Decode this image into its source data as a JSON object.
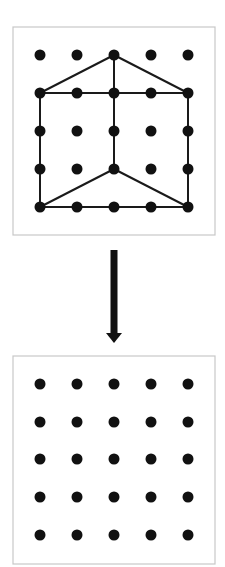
{
  "diagram": {
    "colors": {
      "dot": "#111111",
      "line": "#1a1a1a",
      "frame": "#c8c8c8",
      "background": "#ffffff"
    },
    "grid_columns": [
      40,
      77,
      114,
      151,
      188
    ],
    "top_board": {
      "frame": {
        "x": 13,
        "y": 27,
        "w": 202,
        "h": 208
      },
      "grid_rows": [
        55,
        93,
        131,
        169,
        207
      ],
      "segments": [
        [
          [
            0,
            1
          ],
          [
            2,
            0
          ]
        ],
        [
          [
            2,
            0
          ],
          [
            4,
            1
          ]
        ],
        [
          [
            0,
            1
          ],
          [
            4,
            1
          ]
        ],
        [
          [
            2,
            0
          ],
          [
            2,
            3
          ]
        ],
        [
          [
            0,
            1
          ],
          [
            0,
            4
          ]
        ],
        [
          [
            4,
            1
          ],
          [
            4,
            4
          ]
        ],
        [
          [
            0,
            4
          ],
          [
            4,
            4
          ]
        ],
        [
          [
            0,
            4
          ],
          [
            2,
            3
          ]
        ],
        [
          [
            2,
            3
          ],
          [
            4,
            4
          ]
        ]
      ]
    },
    "arrow": {
      "x": 114,
      "y1": 250,
      "y2": 343,
      "direction": "down"
    },
    "bottom_board": {
      "frame": {
        "x": 13,
        "y": 356,
        "w": 202,
        "h": 208
      },
      "grid_rows": [
        384,
        422,
        459,
        497,
        535
      ],
      "segments": []
    }
  }
}
